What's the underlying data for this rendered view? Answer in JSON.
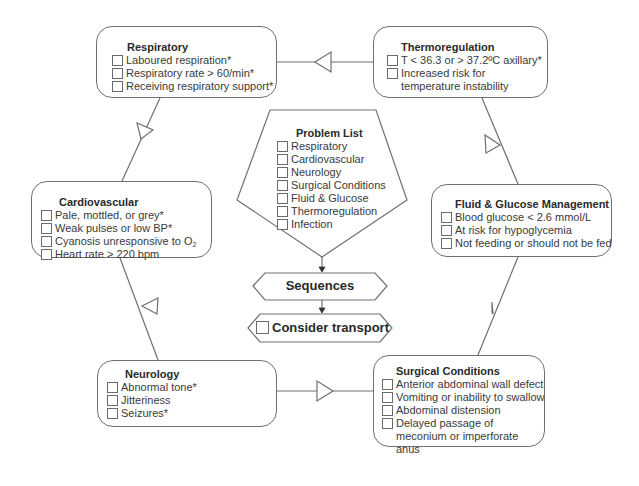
{
  "diagram": {
    "colors": {
      "stroke": "#707070",
      "text": "#3a3a3a",
      "background": "#ffffff"
    },
    "problem_list": {
      "title": "Problem List",
      "items": [
        "Respiratory",
        "Cardiovascular",
        "Neurology",
        "Surgical Conditions",
        "Fluid & Glucose",
        "Thermoregulation",
        "Infection"
      ]
    },
    "sequences": {
      "label": "Sequences"
    },
    "consider_transport": {
      "label": "Consider transport"
    },
    "respiratory": {
      "title": "Respiratory",
      "items": [
        "Laboured respiration*",
        "Respiratory rate > 60/min*",
        "Receiving respiratory support*"
      ]
    },
    "thermoregulation": {
      "title": "Thermoregulation",
      "items": [
        "T < 36.3 or > 37.2ºC axillary*",
        "Increased risk for temperature instability"
      ]
    },
    "cardiovascular": {
      "title": "Cardiovascular",
      "items": [
        "Pale, mottled, or grey*",
        "Weak pulses or low BP*",
        "Cyanosis unresponsive to O",
        "Heart rate > 220 bpm"
      ],
      "o2_subscript": "2"
    },
    "fluid_glucose": {
      "title": "Fluid & Glucose Management",
      "items": [
        "Blood glucose < 2.6 mmol/L",
        "At risk for hypoglycemia",
        "Not feeding or should not be fed"
      ]
    },
    "neurology": {
      "title": "Neurology",
      "items": [
        "Abnormal tone*",
        "Jitteriness",
        "Seizures*"
      ]
    },
    "surgical": {
      "title": "Surgical Conditions",
      "items": [
        "Anterior abdominal wall defect",
        "Vomiting or inability to swallow",
        "Abdominal distension",
        "Delayed passage of meconium or imperforate anus"
      ]
    }
  }
}
